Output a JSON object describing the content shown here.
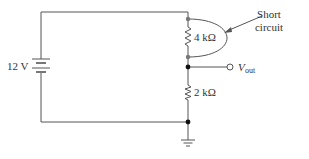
{
  "diagram": {
    "type": "circuit",
    "source": {
      "label": "12 V",
      "kind": "battery"
    },
    "resistors": [
      {
        "id": "R1",
        "label": "4 kΩ",
        "note": "shorted"
      },
      {
        "id": "R2",
        "label": "2 kΩ"
      }
    ],
    "output": {
      "label_main": "V",
      "label_sub": "out"
    },
    "annotation": {
      "line1": "Short",
      "line2": "circuit"
    },
    "ground": {
      "kind": "ground-symbol"
    },
    "colors": {
      "wire": "#555555",
      "node_dark": "#111111",
      "node_gray": "#777777",
      "text": "#333333"
    }
  }
}
